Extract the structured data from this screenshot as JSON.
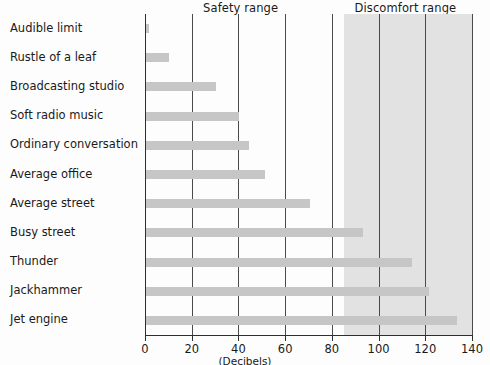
{
  "chart_data": {
    "type": "bar",
    "orientation": "horizontal",
    "title": "",
    "xlabel": "(Decibels)",
    "ylabel": "",
    "xlim": [
      0,
      140
    ],
    "xticks": [
      0,
      20,
      40,
      60,
      80,
      100,
      120,
      140
    ],
    "grid": true,
    "grid_axis": "x",
    "legend": "none",
    "categories": [
      "Audible limit",
      "Rustle of a leaf",
      "Broadcasting studio",
      "Soft radio music",
      "Ordinary conversation",
      "Average office",
      "Average street",
      "Busy street",
      "Thunder",
      "Jackhammer",
      "Jet engine"
    ],
    "values": [
      1,
      10,
      30,
      40,
      44,
      51,
      70,
      93,
      114,
      121,
      133
    ],
    "bar_color": "#c6c6c6",
    "annotations": [
      {
        "name": "safety-range",
        "label": "Safety range",
        "from": 0,
        "to": 85,
        "shaded": false,
        "label_x": 42
      },
      {
        "name": "discomfort-range",
        "label": "Discomfort range",
        "from": 85,
        "to": 140,
        "shaded": true,
        "shade_color": "#e2e2e2",
        "label_x": 112
      }
    ]
  }
}
